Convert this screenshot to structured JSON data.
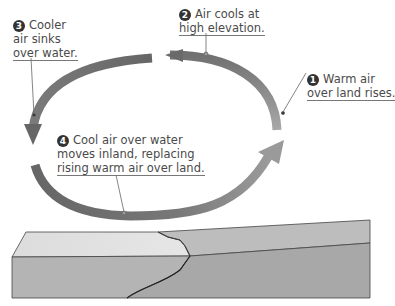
{
  "diagram": {
    "type": "convection-cycle",
    "topic": "Sea breeze circulation",
    "colors": {
      "arrow_cool": "#6e6e6e",
      "arrow_warm": "#9a9a9a",
      "land_top": "#bdbdbd",
      "water_top": "#dedede",
      "land_side": "#a8a8a8",
      "water_side": "#b4b4b4",
      "outline": "#444444",
      "text": "#4a4a4a"
    },
    "steps": [
      {
        "number": "1",
        "lines": [
          "Warm air",
          "over land rises."
        ]
      },
      {
        "number": "2",
        "lines": [
          "Air cools at",
          "high elevation."
        ]
      },
      {
        "number": "3",
        "lines": [
          "Cooler",
          "air sinks",
          "over water."
        ]
      },
      {
        "number": "4",
        "lines": [
          "Cool air over water",
          "moves inland, replacing",
          "rising warm air over land."
        ]
      }
    ]
  }
}
